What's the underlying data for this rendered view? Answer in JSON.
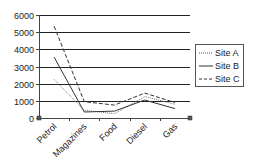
{
  "chart_data": {
    "type": "line",
    "title": "",
    "xlabel": "",
    "ylabel": "",
    "categories": [
      "Petrol",
      "Magazines",
      "Food",
      "Diesel",
      "Gas"
    ],
    "series": [
      {
        "name": "Site A",
        "style": "dotted",
        "values": [
          2250,
          450,
          250,
          1250,
          800
        ]
      },
      {
        "name": "Site B",
        "style": "solid",
        "values": [
          3550,
          350,
          400,
          1050,
          550
        ]
      },
      {
        "name": "Site C",
        "style": "dashed",
        "values": [
          5350,
          950,
          750,
          1450,
          900
        ]
      }
    ],
    "ylim": [
      0,
      6000
    ],
    "yticks": [
      "6000",
      "5000",
      "4000",
      "3000",
      "2000",
      "1000",
      "0"
    ],
    "grid": true,
    "legend_position": "right",
    "colors": {
      "line": "#333333",
      "grid": "#222222",
      "axis": "#444444",
      "legend_border": "#555555"
    }
  },
  "legend": {
    "items": [
      "Site A",
      "Site B",
      "Site C"
    ]
  }
}
